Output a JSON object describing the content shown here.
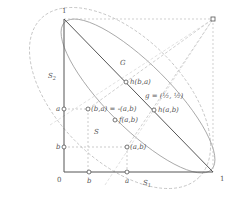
{
  "labels": {
    "top_one": "1",
    "right_one": "1",
    "origin": "0",
    "G": "G",
    "S": "S",
    "S1": "S",
    "S1_sub": "1",
    "S2": "S",
    "S2_sub": "2",
    "ha_b_a": "h(b,a)",
    "ha_a_b": "h(a,b)",
    "g_eq": "g = (½, ½)",
    "ba_eq": "(b,a) = -(a,b)",
    "f_ab": "f(a,b)",
    "ab": "(a,b)",
    "axis_a_y": "a",
    "axis_b_y": "b",
    "axis_a_x": "a",
    "axis_b_x": "b",
    "corner_D": "D"
  },
  "colors": {
    "solid_line": "#555555",
    "dashed_line": "#aaaaaa",
    "curve": "#888888"
  }
}
